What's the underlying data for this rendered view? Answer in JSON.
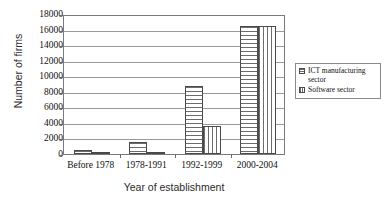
{
  "chart_data": {
    "type": "bar",
    "title": "",
    "xlabel": "Year of establishment",
    "ylabel": "Number of firms",
    "categories": [
      "Before 1978",
      "1978-1991",
      "1992-1999",
      "2000-2004"
    ],
    "series": [
      {
        "name": "ICT manufacturing sector",
        "values": [
          500,
          1500,
          8700,
          16500
        ]
      },
      {
        "name": "Software sector",
        "values": [
          40,
          150,
          3600,
          16500
        ]
      }
    ],
    "ylim": [
      0,
      18000
    ],
    "ytick_step": 2000,
    "yticks": [
      "18000",
      "16000",
      "14000",
      "12000",
      "10000",
      "8000",
      "6000",
      "4000",
      "2000",
      "0"
    ],
    "grid": true,
    "legend_position": "right",
    "legend_entries": [
      "ICT manufacturing sector",
      "Software sector"
    ],
    "colors": {
      "ict": "#6d6d6d",
      "software": "#6d6d6d",
      "frame": "#7a7a7a",
      "grid": "#9a9a9a"
    }
  },
  "legend": {
    "item_ict_line1": "ICT manufacturing",
    "item_ict_line2": "sector",
    "item_software": "Software sector"
  },
  "axes": {
    "y_title": "Number of firms",
    "x_title": "Year of establishment"
  }
}
